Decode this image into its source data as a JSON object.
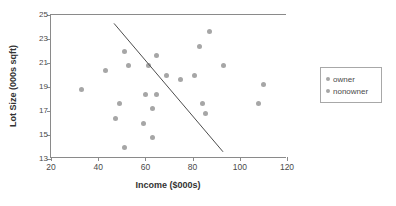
{
  "chart_data": {
    "type": "scatter",
    "title": "",
    "xlabel": "Income ($000s)",
    "ylabel": "Lot Size (000s sqft)",
    "xlim": [
      20,
      120
    ],
    "ylim": [
      13,
      25
    ],
    "xticks": [
      20,
      40,
      60,
      80,
      100,
      120
    ],
    "yticks": [
      13,
      15,
      17,
      19,
      21,
      23,
      25
    ],
    "grid": false,
    "legend_position": "right-outside",
    "legend": [
      "owner",
      "nonowner"
    ],
    "marker_color": "#a6a6a6",
    "line_color": "#4d4d4d",
    "axis_color": "#8a8a8a",
    "series": [
      {
        "name": "owner",
        "points": [
          [
            60.0,
            18.4
          ],
          [
            85.5,
            16.8
          ],
          [
            64.8,
            21.6
          ],
          [
            61.5,
            20.8
          ],
          [
            87.0,
            23.6
          ],
          [
            110.1,
            19.2
          ],
          [
            108.0,
            17.6
          ],
          [
            82.8,
            22.4
          ],
          [
            69.0,
            20.0
          ],
          [
            93.0,
            20.8
          ],
          [
            51.0,
            22.0
          ],
          [
            81.0,
            20.0
          ],
          [
            75.0,
            19.6
          ],
          [
            52.8,
            20.8
          ],
          [
            64.8,
            18.4
          ],
          [
            43.2,
            20.4
          ],
          [
            84.0,
            17.6
          ],
          [
            49.2,
            17.6
          ]
        ]
      },
      {
        "name": "nonowner",
        "points": [
          [
            33.0,
            18.8
          ],
          [
            51.0,
            14.0
          ],
          [
            63.0,
            14.8
          ],
          [
            59.4,
            16.0
          ],
          [
            66.0,
            18.4
          ],
          [
            47.4,
            16.4
          ],
          [
            33.0,
            18.8
          ],
          [
            51.0,
            14.0
          ],
          [
            63.0,
            17.2
          ],
          [
            60.0,
            18.4
          ]
        ]
      }
    ],
    "points": [
      {
        "x": 33.0,
        "y": 18.8
      },
      {
        "x": 43.2,
        "y": 20.4
      },
      {
        "x": 47.4,
        "y": 16.4
      },
      {
        "x": 49.2,
        "y": 17.6
      },
      {
        "x": 51.0,
        "y": 22.0
      },
      {
        "x": 51.0,
        "y": 14.0
      },
      {
        "x": 52.8,
        "y": 20.8
      },
      {
        "x": 59.4,
        "y": 16.0
      },
      {
        "x": 60.0,
        "y": 18.4
      },
      {
        "x": 61.5,
        "y": 20.8
      },
      {
        "x": 63.0,
        "y": 14.8
      },
      {
        "x": 63.0,
        "y": 17.2
      },
      {
        "x": 64.8,
        "y": 21.6
      },
      {
        "x": 64.8,
        "y": 18.4
      },
      {
        "x": 69.0,
        "y": 20.0
      },
      {
        "x": 75.0,
        "y": 19.6
      },
      {
        "x": 81.0,
        "y": 20.0
      },
      {
        "x": 82.8,
        "y": 22.4
      },
      {
        "x": 84.0,
        "y": 17.6
      },
      {
        "x": 85.5,
        "y": 16.8
      },
      {
        "x": 87.0,
        "y": 23.6
      },
      {
        "x": 93.0,
        "y": 20.8
      },
      {
        "x": 108.0,
        "y": 17.6
      },
      {
        "x": 110.1,
        "y": 19.2
      }
    ],
    "annotations": [
      {
        "type": "line",
        "name": "separating-line",
        "x1": 46.7,
        "y1": 24.3,
        "x2": 92.9,
        "y2": 13.6
      }
    ]
  }
}
